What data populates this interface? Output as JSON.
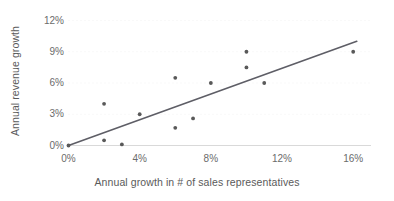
{
  "chart_data": {
    "type": "scatter",
    "title": "",
    "xlabel": "Annual growth in # of sales representatives",
    "ylabel": "Annual revenue growth",
    "xlim": [
      0,
      17
    ],
    "ylim": [
      0,
      12
    ],
    "grid": true,
    "grid_axis": "y",
    "legend": "none",
    "x_ticks": [
      {
        "value": 0,
        "label": "0%"
      },
      {
        "value": 4,
        "label": "4%"
      },
      {
        "value": 8,
        "label": "8%"
      },
      {
        "value": 12,
        "label": "12%"
      },
      {
        "value": 16,
        "label": "16%"
      }
    ],
    "y_ticks": [
      {
        "value": 0,
        "label": "0%"
      },
      {
        "value": 3,
        "label": "3%"
      },
      {
        "value": 6,
        "label": "6%"
      },
      {
        "value": 9,
        "label": "9%"
      },
      {
        "value": 12,
        "label": "12%"
      }
    ],
    "series": [
      {
        "name": "Companies",
        "marker": "circle",
        "color": "#595959",
        "points": [
          {
            "x": 0,
            "y": 0.0
          },
          {
            "x": 2,
            "y": 4.0
          },
          {
            "x": 2,
            "y": 0.5
          },
          {
            "x": 3,
            "y": 0.1
          },
          {
            "x": 4,
            "y": 3.0
          },
          {
            "x": 6,
            "y": 6.5
          },
          {
            "x": 6,
            "y": 1.7
          },
          {
            "x": 7,
            "y": 2.6
          },
          {
            "x": 8,
            "y": 6.0
          },
          {
            "x": 10,
            "y": 9.0
          },
          {
            "x": 10,
            "y": 7.5
          },
          {
            "x": 11,
            "y": 6.0
          },
          {
            "x": 16,
            "y": 9.0
          }
        ]
      }
    ],
    "trendline": {
      "name": "Linear trendline",
      "color": "#5e5e66",
      "from": {
        "x": 0,
        "y": 0.0
      },
      "to": {
        "x": 16.2,
        "y": 10.0
      }
    },
    "colors": {
      "marker": "#595959",
      "trendline": "#5e5e66",
      "axis": "#d9d9d9",
      "grid": "#f2f2f2",
      "tick_text": "#6b6b6b",
      "title_text": "#5a5a5a",
      "background": "#ffffff"
    }
  }
}
